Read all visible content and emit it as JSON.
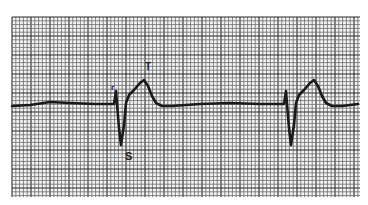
{
  "figure": {
    "type": "ecg-strip",
    "background": "#ffffff",
    "grid": {
      "x0": 12,
      "y0": 17,
      "x1": 360,
      "y1": 197,
      "minor": 3.8,
      "major": 19,
      "minor_color": "#6a6a6a",
      "major_color": "#2a2a2a"
    },
    "trace_color": "#1a1a1a",
    "labels": {
      "r": "r",
      "s": "S",
      "t": "T"
    },
    "beats": [
      {
        "name": "beat-1",
        "r_x": 116
      },
      {
        "name": "beat-2",
        "r_x": 286
      }
    ]
  }
}
